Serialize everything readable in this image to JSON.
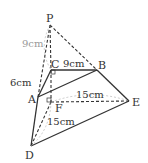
{
  "figure": {
    "points": {
      "P": {
        "label": "P",
        "x": 50,
        "y": 25
      },
      "C": {
        "label": "C",
        "x": 51,
        "y": 70
      },
      "B": {
        "label": "B",
        "x": 97,
        "y": 70
      },
      "A": {
        "label": "A",
        "x": 38,
        "y": 97
      },
      "F": {
        "label": "F",
        "x": 51,
        "y": 102
      },
      "E": {
        "label": "E",
        "x": 129,
        "y": 101
      },
      "D": {
        "label": "D",
        "x": 31,
        "y": 146
      }
    },
    "measurements": {
      "PC": "9cm",
      "CB": "9cm",
      "AC": "6cm",
      "FE": "15cm",
      "FD": "15cm"
    },
    "colors": {
      "line": "#333333",
      "grey_label": "#999999"
    }
  }
}
